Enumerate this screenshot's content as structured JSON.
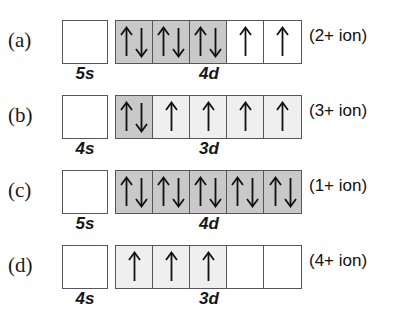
{
  "figure": {
    "colors": {
      "box_border": "#55565a",
      "fill_paired": "#c9c9c9",
      "fill_single": "#efefef",
      "fill_empty": "#ffffff",
      "text": "#111111"
    },
    "arrow_glyphs": {
      "up": "↑",
      "down": "↓"
    }
  },
  "rows": [
    {
      "part": "(a)",
      "s_orbital": {
        "label": "5s",
        "electrons": 0
      },
      "d_orbital": {
        "label": "4d",
        "cells": [
          {
            "electrons": 2,
            "spins": [
              "up",
              "down"
            ],
            "fill": "paired"
          },
          {
            "electrons": 2,
            "spins": [
              "up",
              "down"
            ],
            "fill": "paired"
          },
          {
            "electrons": 2,
            "spins": [
              "up",
              "down"
            ],
            "fill": "paired"
          },
          {
            "electrons": 1,
            "spins": [
              "up"
            ],
            "fill": "empty"
          },
          {
            "electrons": 1,
            "spins": [
              "up"
            ],
            "fill": "empty"
          }
        ],
        "total_electrons": 8
      },
      "ion": "(2+ ion)"
    },
    {
      "part": "(b)",
      "s_orbital": {
        "label": "4s",
        "electrons": 0
      },
      "d_orbital": {
        "label": "3d",
        "cells": [
          {
            "electrons": 2,
            "spins": [
              "up",
              "down"
            ],
            "fill": "paired"
          },
          {
            "electrons": 1,
            "spins": [
              "up"
            ],
            "fill": "single"
          },
          {
            "electrons": 1,
            "spins": [
              "up"
            ],
            "fill": "single"
          },
          {
            "electrons": 1,
            "spins": [
              "up"
            ],
            "fill": "single"
          },
          {
            "electrons": 1,
            "spins": [
              "up"
            ],
            "fill": "single"
          }
        ],
        "total_electrons": 6
      },
      "ion": "(3+ ion)"
    },
    {
      "part": "(c)",
      "s_orbital": {
        "label": "5s",
        "electrons": 0
      },
      "d_orbital": {
        "label": "4d",
        "cells": [
          {
            "electrons": 2,
            "spins": [
              "up",
              "down"
            ],
            "fill": "paired"
          },
          {
            "electrons": 2,
            "spins": [
              "up",
              "down"
            ],
            "fill": "paired"
          },
          {
            "electrons": 2,
            "spins": [
              "up",
              "down"
            ],
            "fill": "paired"
          },
          {
            "electrons": 2,
            "spins": [
              "up",
              "down"
            ],
            "fill": "paired"
          },
          {
            "electrons": 2,
            "spins": [
              "up",
              "down"
            ],
            "fill": "paired"
          }
        ],
        "total_electrons": 10
      },
      "ion": "(1+ ion)"
    },
    {
      "part": "(d)",
      "s_orbital": {
        "label": "4s",
        "electrons": 0
      },
      "d_orbital": {
        "label": "3d",
        "cells": [
          {
            "electrons": 1,
            "spins": [
              "up"
            ],
            "fill": "single"
          },
          {
            "electrons": 1,
            "spins": [
              "up"
            ],
            "fill": "single"
          },
          {
            "electrons": 1,
            "spins": [
              "up"
            ],
            "fill": "single"
          },
          {
            "electrons": 0,
            "spins": [],
            "fill": "empty"
          },
          {
            "electrons": 0,
            "spins": [],
            "fill": "empty"
          }
        ],
        "total_electrons": 3
      },
      "ion": "(4+ ion)"
    }
  ]
}
